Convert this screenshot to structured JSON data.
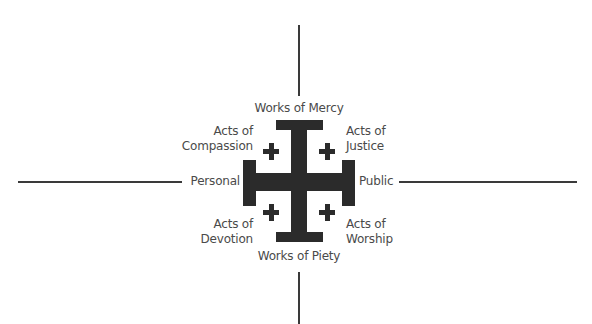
{
  "diagram": {
    "type": "jerusalem-cross-quadrant",
    "colors": {
      "cross": "#2b2b2b",
      "axis": "#3a3a3a",
      "text": "#4a4a4a",
      "background": "#ffffff"
    },
    "axes": {
      "top": "Works of Mercy",
      "bottom": "Works of Piety",
      "left": "Personal",
      "right": "Public"
    },
    "quadrants": {
      "top_left": [
        "Acts of",
        "Compassion"
      ],
      "top_right": [
        "Acts of",
        "Justice"
      ],
      "bottom_left": [
        "Acts of",
        "Devotion"
      ],
      "bottom_right": [
        "Acts of",
        "Worship"
      ]
    }
  }
}
